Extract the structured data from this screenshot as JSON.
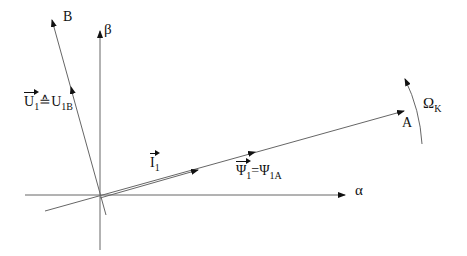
{
  "diagram": {
    "type": "phasor-diagram",
    "axes": {
      "alpha_label": "α",
      "beta_label": "β"
    },
    "lines": {
      "a_axis_label": "A",
      "b_axis_label": "B"
    },
    "phasors": {
      "voltage": {
        "symbol": "U",
        "subscript": "1",
        "relation": "≙",
        "rhs_symbol": "U",
        "rhs_subscript": "1B"
      },
      "current": {
        "symbol": "I",
        "subscript": "1"
      },
      "flux": {
        "symbol": "Ψ",
        "subscript": "1",
        "relation": "=",
        "rhs_symbol": "Ψ",
        "rhs_subscript": "1A"
      }
    },
    "rotation": {
      "symbol": "Ω",
      "subscript": "K"
    },
    "colors": {
      "line": "#555555",
      "text": "#111111",
      "background": "#ffffff"
    }
  }
}
